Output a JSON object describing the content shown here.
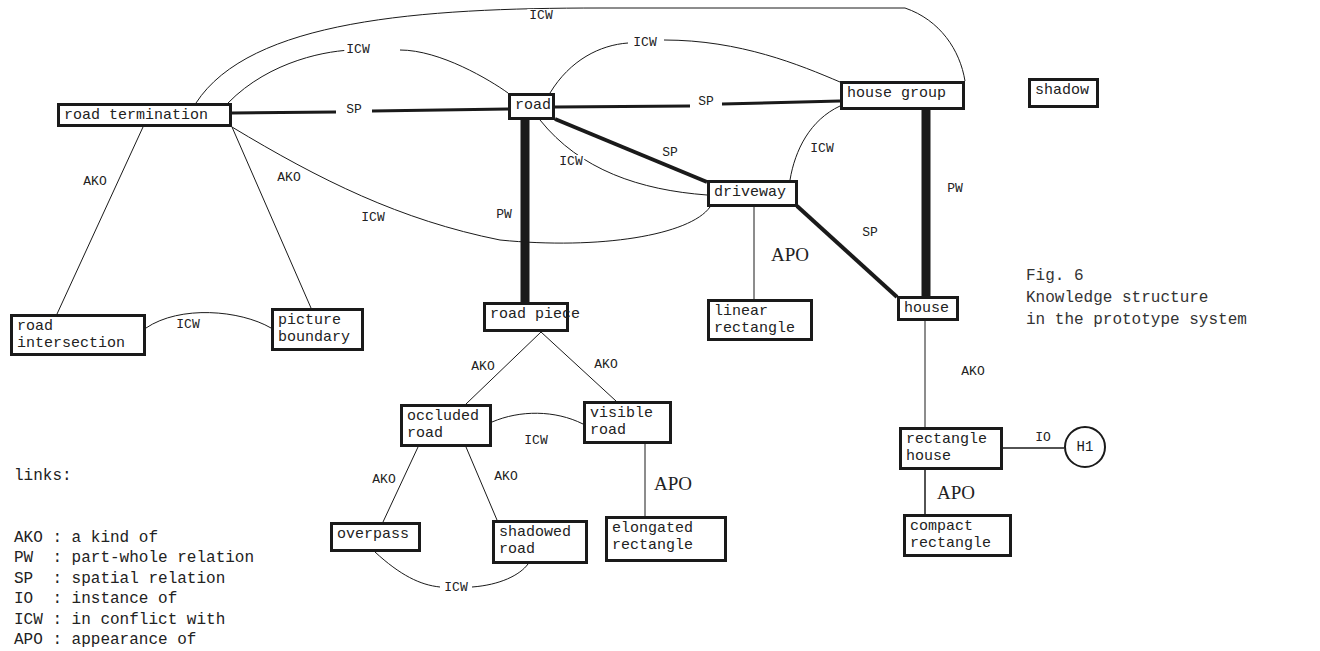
{
  "figure": {
    "number": "Fig. 6",
    "caption_line1": "Knowledge structure",
    "caption_line2": "in the prototype system"
  },
  "colors": {
    "ink": "#1a1a1a",
    "paper": "#ffffff"
  },
  "legend": {
    "title": "links:",
    "items": [
      {
        "abbr": "AKO",
        "desc": "a kind of"
      },
      {
        "abbr": "PW",
        "desc": "part-whole relation"
      },
      {
        "abbr": "SP",
        "desc": "spatial relation"
      },
      {
        "abbr": "IO",
        "desc": "instance of"
      },
      {
        "abbr": "ICW",
        "desc": "in conflict with"
      },
      {
        "abbr": "APO",
        "desc": "appearance of"
      }
    ]
  },
  "nodes": [
    {
      "id": "road_termination",
      "label": "road termination",
      "x": 57,
      "y": 103,
      "w": 175,
      "h": 24
    },
    {
      "id": "road",
      "label": "road",
      "x": 508,
      "y": 93,
      "w": 47,
      "h": 27
    },
    {
      "id": "house_group",
      "label": "house group",
      "x": 840,
      "y": 81,
      "w": 125,
      "h": 29
    },
    {
      "id": "shadow",
      "label": "shadow",
      "x": 1028,
      "y": 78,
      "w": 71,
      "h": 30
    },
    {
      "id": "driveway",
      "label": "driveway",
      "x": 707,
      "y": 180,
      "w": 91,
      "h": 27
    },
    {
      "id": "road_intersection",
      "label": "road\nintersection",
      "x": 10,
      "y": 314,
      "w": 136,
      "h": 42
    },
    {
      "id": "picture_boundary",
      "label": "picture\nboundary",
      "x": 271,
      "y": 308,
      "w": 93,
      "h": 43
    },
    {
      "id": "road_piece",
      "label": "road piece",
      "x": 483,
      "y": 302,
      "w": 86,
      "h": 30
    },
    {
      "id": "linear_rectangle",
      "label": "linear\nrectangle",
      "x": 707,
      "y": 299,
      "w": 106,
      "h": 42
    },
    {
      "id": "house",
      "label": "house",
      "x": 897,
      "y": 296,
      "w": 62,
      "h": 25
    },
    {
      "id": "occluded_road",
      "label": "occluded\nroad",
      "x": 400,
      "y": 404,
      "w": 92,
      "h": 43
    },
    {
      "id": "visible_road",
      "label": "visible\nroad",
      "x": 583,
      "y": 401,
      "w": 89,
      "h": 43
    },
    {
      "id": "rectangle_house",
      "label": "rectangle\nhouse",
      "x": 899,
      "y": 427,
      "w": 104,
      "h": 43
    },
    {
      "id": "overpass",
      "label": "overpass",
      "x": 330,
      "y": 522,
      "w": 91,
      "h": 30
    },
    {
      "id": "shadowed_road",
      "label": "shadowed\nroad",
      "x": 492,
      "y": 520,
      "w": 96,
      "h": 44
    },
    {
      "id": "elongated_rectangle",
      "label": "elongated\nrectangle",
      "x": 605,
      "y": 516,
      "w": 122,
      "h": 46
    },
    {
      "id": "compact_rectangle",
      "label": "compact\nrectangle",
      "x": 903,
      "y": 514,
      "w": 109,
      "h": 43
    }
  ],
  "instance": {
    "id": "H1",
    "label": "H1",
    "cx": 1085,
    "cy": 447,
    "r": 21
  },
  "edges": [
    {
      "type": "ICW",
      "from": "road_termination",
      "to": "house_group",
      "weight": 1,
      "path": "M196,103 C250,20 420,8 600,8 L905,8 C940,20 960,50 965,81"
    },
    {
      "type": "ICW",
      "from": "road_termination",
      "to": "road",
      "weight": 1,
      "path": "M228,103 C270,60 330,50 355,50 M400,50 C440,50 490,80 508,93"
    },
    {
      "type": "ICW",
      "from": "road",
      "to": "house_group",
      "weight": 1,
      "path": "M550,93 C570,60 600,45 628,43 M664,40 C740,40 800,65 840,82"
    },
    {
      "type": "SP",
      "from": "road_termination",
      "to": "road",
      "weight": 3,
      "path": "M232,113 L336,112 M372,111 L508,109"
    },
    {
      "type": "SP",
      "from": "road",
      "to": "house_group",
      "weight": 3,
      "path": "M555,107 L690,106 M722,104 L840,101"
    },
    {
      "type": "SP",
      "from": "road",
      "to": "driveway",
      "weight": 4,
      "path": "M555,119 L707,182"
    },
    {
      "type": "ICW",
      "from": "road",
      "to": "driveway",
      "weight": 1,
      "path": "M540,120 C580,170 640,190 707,195"
    },
    {
      "type": "ICW",
      "from": "house_group",
      "to": "driveway",
      "weight": 1,
      "path": "M840,106 C810,120 795,150 790,180"
    },
    {
      "type": "PW",
      "from": "road",
      "to": "road_piece",
      "weight": 9,
      "path": "M525,120 L525,302"
    },
    {
      "type": "PW",
      "from": "house_group",
      "to": "house",
      "weight": 9,
      "path": "M926,110 L926,296"
    },
    {
      "type": "SP",
      "from": "driveway",
      "to": "house",
      "weight": 4,
      "path": "M797,206 L897,297"
    },
    {
      "type": "APO",
      "from": "driveway",
      "to": "linear_rectangle",
      "weight": 1,
      "path": "M754,207 L754,299"
    },
    {
      "type": "AKO",
      "from": "road_termination",
      "to": "road_intersection",
      "weight": 1,
      "path": "M143,127 L57,314"
    },
    {
      "type": "AKO",
      "from": "road_termination",
      "to": "picture_boundary",
      "weight": 1,
      "path": "M232,127 L311,308"
    },
    {
      "type": "ICW",
      "from": "road_termination",
      "to": "driveway",
      "weight": 1,
      "path": "M232,127 C320,180 400,220 500,240 C600,250 690,235 710,207"
    },
    {
      "type": "ICW",
      "from": "road_intersection",
      "to": "picture_boundary",
      "weight": 1,
      "path": "M146,328 C180,305 240,310 271,328"
    },
    {
      "type": "AKO",
      "from": "road_piece",
      "to": "occluded_road",
      "weight": 1,
      "path": "M541,332 L466,404"
    },
    {
      "type": "AKO",
      "from": "road_piece",
      "to": "visible_road",
      "weight": 1,
      "path": "M541,332 L616,401"
    },
    {
      "type": "ICW",
      "from": "occluded_road",
      "to": "visible_road",
      "weight": 1,
      "path": "M492,422 C520,410 555,410 583,424"
    },
    {
      "type": "AKO",
      "from": "occluded_road",
      "to": "overpass",
      "weight": 1,
      "path": "M418,447 L383,522"
    },
    {
      "type": "AKO",
      "from": "occluded_road",
      "to": "shadowed_road",
      "weight": 1,
      "path": "M466,447 L497,520"
    },
    {
      "type": "ICW",
      "from": "overpass",
      "to": "shadowed_road",
      "weight": 1,
      "path": "M375,552 C400,575 420,585 440,587 M472,587 C500,585 520,575 528,564"
    },
    {
      "type": "APO",
      "from": "visible_road",
      "to": "elongated_rectangle",
      "weight": 1,
      "path": "M645,444 L645,516"
    },
    {
      "type": "AKO",
      "from": "house",
      "to": "rectangle_house",
      "weight": 1,
      "path": "M925,321 L925,427"
    },
    {
      "type": "IO",
      "from": "rectangle_house",
      "to": "H1",
      "weight": 1.5,
      "path": "M1003,448 L1064,448"
    },
    {
      "type": "APO",
      "from": "rectangle_house",
      "to": "compact_rectangle",
      "weight": 1.5,
      "path": "M925,470 L925,514"
    }
  ],
  "edge_labels": [
    {
      "text": "ICW",
      "x": 541,
      "y": 16,
      "style": "small"
    },
    {
      "text": "ICW",
      "x": 358,
      "y": 50,
      "style": "small"
    },
    {
      "text": "ICW",
      "x": 645,
      "y": 43,
      "style": "small"
    },
    {
      "text": "SP",
      "x": 354,
      "y": 110,
      "style": "small"
    },
    {
      "text": "SP",
      "x": 706,
      "y": 102,
      "style": "small"
    },
    {
      "text": "ICW",
      "x": 571,
      "y": 162,
      "style": "small"
    },
    {
      "text": "SP",
      "x": 670,
      "y": 153,
      "style": "small"
    },
    {
      "text": "ICW",
      "x": 822,
      "y": 149,
      "style": "small"
    },
    {
      "text": "AKO",
      "x": 95,
      "y": 182,
      "style": "small"
    },
    {
      "text": "AKO",
      "x": 289,
      "y": 178,
      "style": "small"
    },
    {
      "text": "ICW",
      "x": 373,
      "y": 218,
      "style": "small"
    },
    {
      "text": "PW",
      "x": 504,
      "y": 215,
      "style": "small"
    },
    {
      "text": "PW",
      "x": 955,
      "y": 189,
      "style": "small"
    },
    {
      "text": "SP",
      "x": 870,
      "y": 233,
      "style": "small"
    },
    {
      "text": "APO",
      "x": 790,
      "y": 255,
      "style": "big"
    },
    {
      "text": "ICW",
      "x": 188,
      "y": 325,
      "style": "small"
    },
    {
      "text": "AKO",
      "x": 483,
      "y": 367,
      "style": "small"
    },
    {
      "text": "AKO",
      "x": 606,
      "y": 365,
      "style": "small"
    },
    {
      "text": "ICW",
      "x": 536,
      "y": 441,
      "style": "small"
    },
    {
      "text": "AKO",
      "x": 384,
      "y": 480,
      "style": "small"
    },
    {
      "text": "AKO",
      "x": 506,
      "y": 477,
      "style": "small"
    },
    {
      "text": "APO",
      "x": 673,
      "y": 484,
      "style": "big"
    },
    {
      "text": "ICW",
      "x": 456,
      "y": 588,
      "style": "small"
    },
    {
      "text": "AKO",
      "x": 973,
      "y": 372,
      "style": "small"
    },
    {
      "text": "IO",
      "x": 1043,
      "y": 438,
      "style": "small"
    },
    {
      "text": "APO",
      "x": 956,
      "y": 493,
      "style": "big"
    }
  ]
}
